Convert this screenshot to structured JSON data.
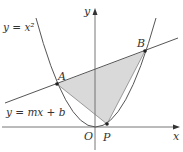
{
  "diagram": {
    "labels": {
      "parabola": "y = x²",
      "line": "y = mx + b",
      "point_a": "A",
      "point_b": "B",
      "point_p": "P",
      "origin": "O",
      "x_axis": "x",
      "y_axis": "y"
    },
    "colors": {
      "curve": "#555555",
      "axes": "#666666",
      "shade": "#d9d9d9",
      "points": "#222222"
    }
  }
}
